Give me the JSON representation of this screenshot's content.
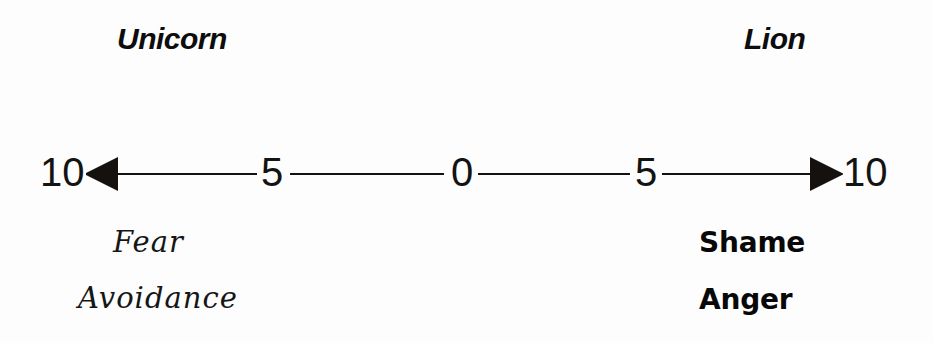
{
  "figure": {
    "type": "bidirectional-scale-diagram",
    "background_color": "#fdfdfd",
    "ink_color": "#131313"
  },
  "poles": {
    "left": "Unicorn",
    "right": "Lion"
  },
  "axis": {
    "tick_labels": [
      "10",
      "5",
      "0",
      "5",
      "10"
    ],
    "left_arrow": "left-arrowhead",
    "right_arrow": "right-arrowhead"
  },
  "descriptors": {
    "left": [
      "Fear",
      "Avoidance"
    ],
    "right": [
      "Shame",
      "Anger"
    ]
  },
  "chart_data": {
    "type": "line",
    "title": "",
    "xlabel": "",
    "ylabel": "",
    "categories": [
      "10",
      "5",
      "0",
      "5",
      "10"
    ],
    "x": [
      -10,
      -5,
      0,
      5,
      10
    ],
    "tick_labels": [
      "10",
      "5",
      "0",
      "5",
      "10"
    ],
    "xlim": [
      -10,
      10
    ],
    "grid": false,
    "legend": "none",
    "annotations": [
      {
        "text": "Unicorn",
        "position": "top-left",
        "style": "bold-italic"
      },
      {
        "text": "Lion",
        "position": "top-right",
        "style": "bold-italic"
      },
      {
        "text": "Fear",
        "position": "bottom-left",
        "style": "script"
      },
      {
        "text": "Avoidance",
        "position": "bottom-left",
        "style": "script"
      },
      {
        "text": "Shame",
        "position": "bottom-right",
        "style": "heavy-bold"
      },
      {
        "text": "Anger",
        "position": "bottom-right",
        "style": "heavy-bold"
      }
    ]
  }
}
